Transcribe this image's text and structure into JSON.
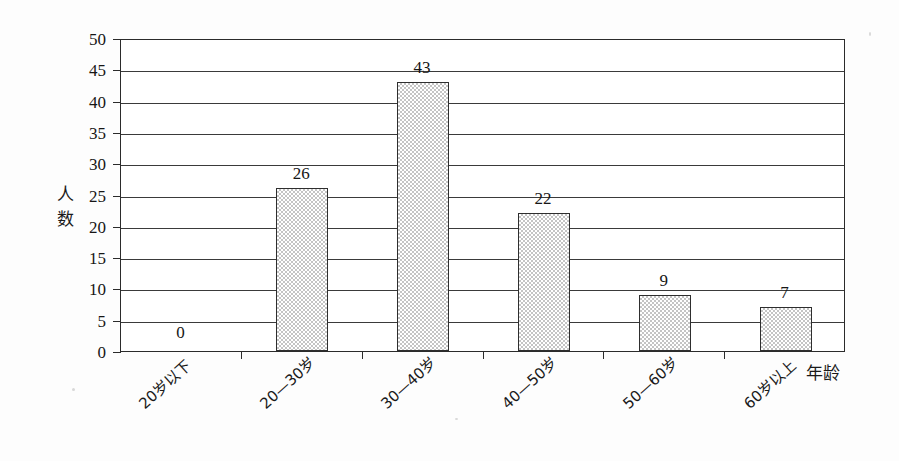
{
  "chart_data": {
    "type": "bar",
    "title": "",
    "xlabel": "年龄",
    "ylabel": "人数",
    "categories": [
      "20岁以下",
      "20—30岁",
      "30—40岁",
      "40—50岁",
      "50—60岁",
      "60岁以上"
    ],
    "values": [
      0,
      26,
      43,
      22,
      9,
      7
    ],
    "value_labels": [
      "0",
      "26",
      "43",
      "22",
      "9",
      "7"
    ],
    "ylim": [
      0,
      50
    ],
    "ytick_step": 5,
    "ytick_labels": [
      "50",
      "45",
      "40",
      "35",
      "30",
      "25",
      "20",
      "15",
      "10",
      "5",
      "0"
    ],
    "ytick_values": [
      50,
      45,
      40,
      35,
      30,
      25,
      20,
      15,
      10,
      5,
      0
    ],
    "grid": "horizontal",
    "legend": "none",
    "bar_fill": "#c4c4c4",
    "bar_edge": "#2e2e2e",
    "axis_color": "#2b2b2b"
  },
  "axes": {
    "y_title": "人\n数",
    "x_title": "年龄"
  }
}
